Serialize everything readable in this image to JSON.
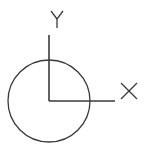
{
  "diagram": {
    "type": "ucs-icon",
    "axis_labels": {
      "x": "X",
      "y": "Y"
    },
    "colors": {
      "stroke": "#3a3a3a",
      "background": "#ffffff"
    }
  }
}
